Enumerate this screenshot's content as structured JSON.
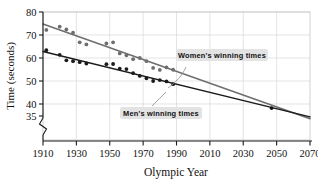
{
  "chart_data": {
    "type": "scatter",
    "title": "",
    "xlabel": "Olympic Year",
    "ylabel": "Time (seconds)",
    "xlim": [
      1910,
      2070
    ],
    "ylim": [
      33,
      80
    ],
    "xticks": [
      1910,
      1930,
      1950,
      1970,
      1990,
      2010,
      2030,
      2050,
      2070
    ],
    "yticks": [
      35,
      40,
      50,
      60,
      70,
      80
    ],
    "y_axis_break": true,
    "grid": true,
    "legend": "annotations",
    "annotations": [
      {
        "text": "Women's winning times",
        "x": 2002,
        "y": 57.5
      },
      {
        "text": "Men's winning times",
        "x": 1968,
        "y": 42.5
      }
    ],
    "intersection": {
      "x": 2047,
      "y": 38.2,
      "marked": true
    },
    "series": [
      {
        "name": "Women's winning times",
        "color": "#6e6e6e",
        "marker": "circle",
        "trendline": {
          "from": [
            1910,
            74.8
          ],
          "to": [
            2070,
            33.6
          ],
          "color": "#6e6e6e"
        },
        "points": [
          [
            1912,
            72.2
          ],
          [
            1920,
            73.6
          ],
          [
            1924,
            72.4
          ],
          [
            1928,
            71.0
          ],
          [
            1932,
            66.8
          ],
          [
            1936,
            65.9
          ],
          [
            1948,
            66.3
          ],
          [
            1952,
            66.8
          ],
          [
            1956,
            62.0
          ],
          [
            1960,
            61.2
          ],
          [
            1964,
            59.5
          ],
          [
            1968,
            60.0
          ],
          [
            1972,
            58.6
          ],
          [
            1976,
            55.7
          ],
          [
            1980,
            54.8
          ],
          [
            1984,
            55.9
          ],
          [
            1988,
            54.9
          ]
        ]
      },
      {
        "name": "Men's winning times",
        "color": "#1b1b1b",
        "marker": "circle",
        "trendline": {
          "from": [
            1910,
            62.8
          ],
          "to": [
            2070,
            34.4
          ],
          "color": "#1b1b1b"
        },
        "points": [
          [
            1912,
            63.4
          ],
          [
            1920,
            61.4
          ],
          [
            1924,
            59.0
          ],
          [
            1928,
            58.6
          ],
          [
            1932,
            58.2
          ],
          [
            1936,
            57.6
          ],
          [
            1948,
            57.3
          ],
          [
            1952,
            57.4
          ],
          [
            1956,
            55.4
          ],
          [
            1960,
            55.2
          ],
          [
            1964,
            53.4
          ],
          [
            1968,
            52.2
          ],
          [
            1972,
            51.2
          ],
          [
            1976,
            49.99
          ],
          [
            1980,
            50.4
          ],
          [
            1984,
            49.8
          ],
          [
            1988,
            48.6
          ]
        ]
      }
    ]
  },
  "axis": {
    "y_title": "Time (seconds)",
    "x_title": "Olympic Year",
    "y_tick_labels": [
      "80",
      "70",
      "60",
      "50",
      "40",
      "35"
    ],
    "x_tick_labels": [
      "1910",
      "1930",
      "1950",
      "1970",
      "1990",
      "2010",
      "2030",
      "2050",
      "2070"
    ]
  },
  "labels": {
    "womens": "Women's winning times",
    "mens": "Men's winning times"
  },
  "colors": {
    "womens_series": "#6e6e6e",
    "mens_series": "#1b1b1b",
    "grid": "#d8d8d8",
    "frame": "#b9b9b9",
    "annotation_bg": "#e3e3e3"
  }
}
